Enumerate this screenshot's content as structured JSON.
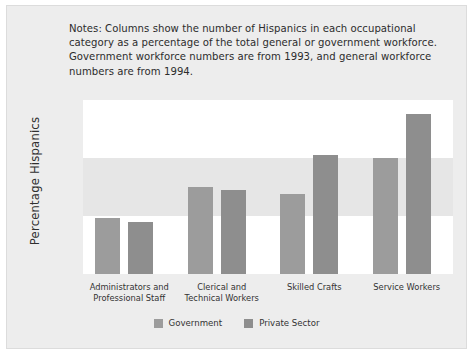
{
  "figure": {
    "notes": "Notes: Columns show the number of Hispanics in each occupational category as a percentage of the total general or government workforce. Government workforce numbers are from 1993, and general workforce numbers are from 1994.",
    "background_color": "#ededed",
    "band_white_color": "#ffffff",
    "band_grey_color": "#e6e6e6"
  },
  "chart_data": {
    "type": "bar",
    "title": "",
    "subtitle": "",
    "xlabel": "",
    "ylabel": "Percentage Hispanics",
    "ylim": [
      0,
      15
    ],
    "yticks": [
      0,
      5,
      10,
      15
    ],
    "ytick_labels": [
      "0",
      "5",
      "10",
      "15"
    ],
    "grid": false,
    "banded_background": true,
    "legend_position": "bottom-center",
    "categories": [
      "Administrators and Professional Staff",
      "Clerical and Technical Workers",
      "Skilled Crafts",
      "Service Workers"
    ],
    "category_lines": [
      [
        "Administrators and",
        "Professional Staff"
      ],
      [
        "Clerical and",
        "Technical Workers"
      ],
      [
        "Skilled Crafts",
        ""
      ],
      [
        "Service Workers",
        ""
      ]
    ],
    "series": [
      {
        "name": "Government",
        "color": "#9c9c9c",
        "values": [
          4.8,
          7.5,
          6.9,
          10.0
        ]
      },
      {
        "name": "Private Sector",
        "color": "#8e8e8e",
        "values": [
          4.5,
          7.2,
          10.3,
          13.8
        ]
      }
    ]
  },
  "legend": {
    "items": [
      {
        "label": "Government",
        "color": "#9c9c9c"
      },
      {
        "label": "Private Sector",
        "color": "#8e8e8e"
      }
    ]
  }
}
